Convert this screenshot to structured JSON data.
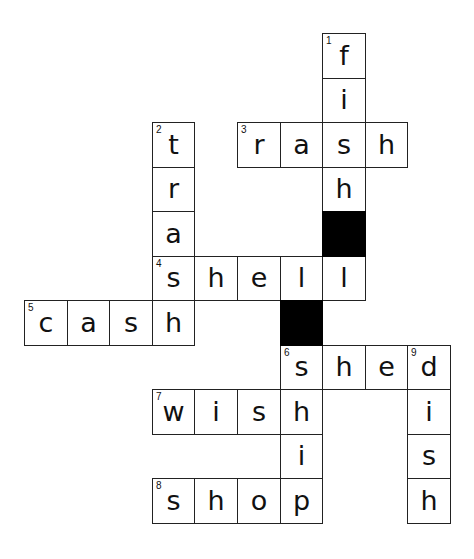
{
  "puzzle": {
    "type": "crossword",
    "grid": {
      "origin_x": 24,
      "origin_y": 33,
      "cell_w": 42.6,
      "cell_h": 44.5
    },
    "black_cells": [
      {
        "row": 4,
        "col": 7
      },
      {
        "row": 6,
        "col": 6
      }
    ],
    "cells": [
      {
        "row": 0,
        "col": 7,
        "letter": "f",
        "num": "1"
      },
      {
        "row": 1,
        "col": 7,
        "letter": "i"
      },
      {
        "row": 2,
        "col": 3,
        "letter": "t",
        "num": "2"
      },
      {
        "row": 2,
        "col": 5,
        "letter": "r",
        "num": "3"
      },
      {
        "row": 2,
        "col": 6,
        "letter": "a"
      },
      {
        "row": 2,
        "col": 7,
        "letter": "s"
      },
      {
        "row": 2,
        "col": 8,
        "letter": "h"
      },
      {
        "row": 3,
        "col": 3,
        "letter": "r"
      },
      {
        "row": 3,
        "col": 7,
        "letter": "h"
      },
      {
        "row": 4,
        "col": 3,
        "letter": "a"
      },
      {
        "row": 5,
        "col": 3,
        "letter": "s",
        "num": "4"
      },
      {
        "row": 5,
        "col": 4,
        "letter": "h"
      },
      {
        "row": 5,
        "col": 5,
        "letter": "e"
      },
      {
        "row": 5,
        "col": 6,
        "letter": "l"
      },
      {
        "row": 5,
        "col": 7,
        "letter": "l"
      },
      {
        "row": 6,
        "col": 0,
        "letter": "c",
        "num": "5"
      },
      {
        "row": 6,
        "col": 1,
        "letter": "a"
      },
      {
        "row": 6,
        "col": 2,
        "letter": "s"
      },
      {
        "row": 6,
        "col": 3,
        "letter": "h"
      },
      {
        "row": 7,
        "col": 6,
        "letter": "s",
        "num": "6"
      },
      {
        "row": 7,
        "col": 7,
        "letter": "h"
      },
      {
        "row": 7,
        "col": 8,
        "letter": "e"
      },
      {
        "row": 7,
        "col": 9,
        "letter": "d",
        "num": "9"
      },
      {
        "row": 8,
        "col": 3,
        "letter": "w",
        "num": "7"
      },
      {
        "row": 8,
        "col": 4,
        "letter": "i"
      },
      {
        "row": 8,
        "col": 5,
        "letter": "s"
      },
      {
        "row": 8,
        "col": 6,
        "letter": "h"
      },
      {
        "row": 8,
        "col": 9,
        "letter": "i"
      },
      {
        "row": 9,
        "col": 6,
        "letter": "i"
      },
      {
        "row": 9,
        "col": 9,
        "letter": "s"
      },
      {
        "row": 10,
        "col": 3,
        "letter": "s",
        "num": "8"
      },
      {
        "row": 10,
        "col": 4,
        "letter": "h"
      },
      {
        "row": 10,
        "col": 5,
        "letter": "o"
      },
      {
        "row": 10,
        "col": 6,
        "letter": "p"
      },
      {
        "row": 10,
        "col": 9,
        "letter": "h"
      }
    ],
    "words": {
      "down": [
        {
          "num": "1",
          "answer": "fish"
        },
        {
          "num": "2",
          "answer": "trash"
        },
        {
          "num": "6",
          "answer": "ship"
        },
        {
          "num": "9",
          "answer": "dish"
        }
      ],
      "across": [
        {
          "num": "3",
          "answer": "rash"
        },
        {
          "num": "4",
          "answer": "shell"
        },
        {
          "num": "5",
          "answer": "cash"
        },
        {
          "num": "6",
          "answer": "shed"
        },
        {
          "num": "7",
          "answer": "wish"
        },
        {
          "num": "8",
          "answer": "shop"
        }
      ]
    }
  }
}
